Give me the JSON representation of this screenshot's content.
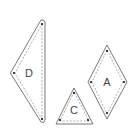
{
  "diagram": {
    "type": "quilt-pattern-pieces",
    "pieces": [
      {
        "label": "D",
        "shape": "right-triangle"
      },
      {
        "label": "C",
        "shape": "equilateral-triangle"
      },
      {
        "label": "A",
        "shape": "diamond"
      }
    ]
  },
  "colors": {
    "outline": "#555555",
    "seam": "#777777",
    "dot": "#111111",
    "label": "#444444"
  }
}
